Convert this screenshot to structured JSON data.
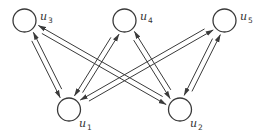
{
  "diagram": {
    "type": "bipartite-directed-graph",
    "colors": {
      "stroke": "#3a3a3a",
      "label": "#333333",
      "background": "#ffffff"
    },
    "nodes": [
      {
        "id": "u3",
        "letter": "u",
        "sub": "3",
        "cx": 24.5,
        "cy": 20.5,
        "r": 11.5,
        "lx": 40,
        "ly": 20
      },
      {
        "id": "u4",
        "letter": "u",
        "sub": "4",
        "cx": 124.5,
        "cy": 20.5,
        "r": 11.5,
        "lx": 140,
        "ly": 20
      },
      {
        "id": "u5",
        "letter": "u",
        "sub": "5",
        "cx": 224.5,
        "cy": 20.5,
        "r": 11.5,
        "lx": 240,
        "ly": 20
      },
      {
        "id": "u1",
        "letter": "u",
        "sub": "1",
        "cx": 69,
        "cy": 109.5,
        "r": 11.5,
        "lx": 79,
        "ly": 127
      },
      {
        "id": "u2",
        "letter": "u",
        "sub": "2",
        "cx": 180,
        "cy": 109.5,
        "r": 11.5,
        "lx": 190,
        "ly": 127
      }
    ],
    "edges": [
      {
        "from": "u3",
        "to": "u1"
      },
      {
        "from": "u1",
        "to": "u3"
      },
      {
        "from": "u3",
        "to": "u2"
      },
      {
        "from": "u2",
        "to": "u3"
      },
      {
        "from": "u4",
        "to": "u1"
      },
      {
        "from": "u1",
        "to": "u4"
      },
      {
        "from": "u4",
        "to": "u2"
      },
      {
        "from": "u2",
        "to": "u4"
      },
      {
        "from": "u5",
        "to": "u1"
      },
      {
        "from": "u1",
        "to": "u5"
      },
      {
        "from": "u5",
        "to": "u2"
      },
      {
        "from": "u2",
        "to": "u5"
      }
    ]
  }
}
